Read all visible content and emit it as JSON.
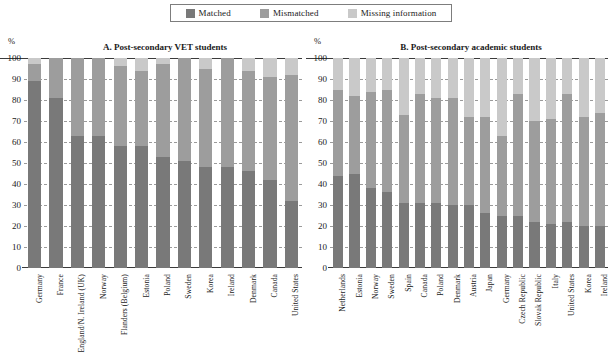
{
  "legend": {
    "items": [
      {
        "label": "Matched",
        "color": "#797979",
        "icon": "square-swatch-icon"
      },
      {
        "label": "Mismatched",
        "color": "#9d9d9d",
        "icon": "square-swatch-icon"
      },
      {
        "label": "Missing information",
        "color": "#c9c9c9",
        "icon": "square-swatch-icon"
      }
    ]
  },
  "axis": {
    "unit": "%",
    "ticks": [
      "100",
      "90",
      "80",
      "70",
      "60",
      "50",
      "40",
      "30",
      "20",
      "10",
      "0"
    ]
  },
  "chart_data": [
    {
      "type": "bar",
      "title": "A. Post-secondary VET students",
      "xlabel": "",
      "ylabel": "%",
      "ylim": [
        0,
        100
      ],
      "grid": true,
      "stacked": true,
      "legend_position": "top-center",
      "categories": [
        "Germany",
        "France",
        "England/N. Ireland (UK)",
        "Norway",
        "Flanders (Belgium)",
        "Estonia",
        "Poland",
        "Sweden",
        "Korea",
        "Ireland",
        "Denmark",
        "Canada",
        "United States"
      ],
      "series": [
        {
          "name": "Matched",
          "values": [
            89,
            81,
            63,
            63,
            58,
            58,
            53,
            51,
            48,
            48,
            46,
            42,
            32
          ]
        },
        {
          "name": "Mismatched",
          "values": [
            8,
            19,
            37,
            37,
            38,
            36,
            44,
            49,
            47,
            52,
            48,
            49,
            60
          ]
        },
        {
          "name": "Missing information",
          "values": [
            3,
            0,
            0,
            0,
            4,
            6,
            3,
            0,
            5,
            0,
            6,
            9,
            8
          ]
        }
      ]
    },
    {
      "type": "bar",
      "title": "B. Post-secondary academic students",
      "xlabel": "",
      "ylabel": "%",
      "ylim": [
        0,
        100
      ],
      "grid": true,
      "stacked": true,
      "legend_position": "top-center",
      "categories": [
        "Netherlands",
        "Estonia",
        "Norway",
        "Sweden",
        "Spain",
        "Canada",
        "Poland",
        "Denmark",
        "Austria",
        "Japan",
        "Germany",
        "Czech Republic",
        "Slovak Republic",
        "Italy",
        "United States",
        "Korea",
        "Ireland"
      ],
      "series": [
        {
          "name": "Matched",
          "values": [
            44,
            45,
            38,
            36,
            31,
            31,
            31,
            30,
            30,
            26,
            25,
            25,
            22,
            21,
            22,
            20,
            20
          ]
        },
        {
          "name": "Mismatched",
          "values": [
            41,
            37,
            46,
            49,
            42,
            52,
            50,
            51,
            42,
            46,
            38,
            58,
            48,
            50,
            61,
            52,
            54
          ]
        },
        {
          "name": "Missing information",
          "values": [
            15,
            18,
            16,
            15,
            27,
            17,
            19,
            19,
            28,
            28,
            37,
            17,
            30,
            29,
            17,
            28,
            26
          ]
        }
      ]
    }
  ]
}
